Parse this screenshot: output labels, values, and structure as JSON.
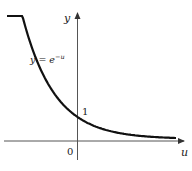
{
  "chart_data": {
    "type": "line",
    "title": "",
    "xlabel": "u",
    "ylabel": "y",
    "series": [
      {
        "name": "y = e^{-u}",
        "function": "exp(-u)",
        "x": [
          -2.2,
          -2,
          -1.5,
          -1,
          -0.5,
          0,
          0.5,
          1,
          1.5,
          2,
          2.5,
          3,
          3.5
        ],
        "values": [
          9.03,
          7.39,
          4.48,
          2.72,
          1.65,
          1.0,
          0.61,
          0.37,
          0.22,
          0.14,
          0.08,
          0.05,
          0.03
        ]
      }
    ],
    "annotations": [
      {
        "text": "y = e^{-u}",
        "position": "upper-left, along curve"
      },
      {
        "text": "1",
        "position": "y-intercept tick label"
      },
      {
        "text": "0",
        "position": "origin"
      }
    ],
    "grid": false,
    "legend": "none",
    "color": "#111111"
  },
  "labels": {
    "y_axis": "y",
    "x_axis": "u",
    "origin": "0",
    "intercept": "1",
    "equation_lhs": "y = e",
    "equation_exp": "−u"
  }
}
